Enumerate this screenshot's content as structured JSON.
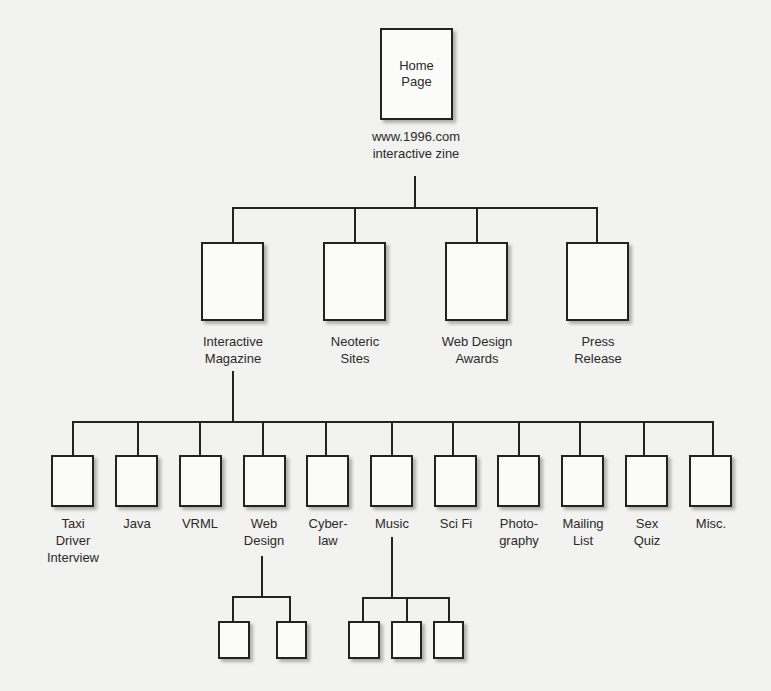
{
  "diagram": {
    "type": "site-hierarchy",
    "root": {
      "box_label": "Home\nPage",
      "caption": "www.1996.com\ninteractive zine"
    },
    "level2": [
      {
        "label": "Interactive\nMagazine"
      },
      {
        "label": "Neoteric\nSites"
      },
      {
        "label": "Web Design\nAwards"
      },
      {
        "label": "Press\nRelease"
      }
    ],
    "level3": [
      {
        "label": "Taxi\nDriver\nInterview"
      },
      {
        "label": "Java"
      },
      {
        "label": "VRML"
      },
      {
        "label": "Web\nDesign"
      },
      {
        "label": "Cyber-\nlaw"
      },
      {
        "label": "Music"
      },
      {
        "label": "Sci Fi"
      },
      {
        "label": "Photo-\ngraphy"
      },
      {
        "label": "Mailing\nList"
      },
      {
        "label": "Sex\nQuiz"
      },
      {
        "label": "Misc."
      }
    ],
    "level4": {
      "web_design_children": 2,
      "music_children": 3
    },
    "colors": {
      "background": "#f2f2f0",
      "line": "#222222",
      "box_fill": "#fbfbfa",
      "text": "#2a2a2a"
    }
  }
}
